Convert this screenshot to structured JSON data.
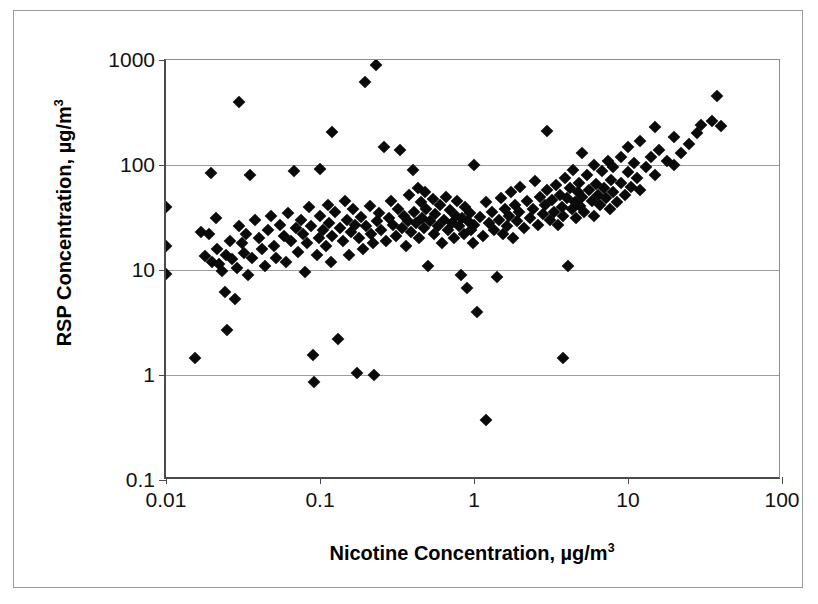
{
  "chart_data": {
    "type": "scatter",
    "title": "",
    "xlabel": "Nicotine Concentration, µg/m",
    "xlabel_sup": "3",
    "ylabel": "RSP Concentration, µg/m",
    "ylabel_sup": "3",
    "xscale": "log",
    "yscale": "log",
    "xlim": [
      0.01,
      100
    ],
    "ylim": [
      0.1,
      1000
    ],
    "xticks": [
      "0.01",
      "0.1",
      "1",
      "10",
      "100"
    ],
    "xtick_values": [
      0.01,
      0.1,
      1,
      10,
      100
    ],
    "yticks": [
      "0.1",
      "1",
      "10",
      "100",
      "1000"
    ],
    "ytick_values": [
      0.1,
      1,
      10,
      100,
      1000
    ],
    "grid": "horizontal",
    "legend": "none",
    "marker": "diamond",
    "marker_color": "#0a0a0a",
    "series": [
      {
        "name": "RSP vs Nicotine",
        "points": [
          [
            0.01,
            40
          ],
          [
            0.01,
            17
          ],
          [
            0.01,
            9.2
          ],
          [
            0.0155,
            1.45
          ],
          [
            0.017,
            23
          ],
          [
            0.018,
            13.5
          ],
          [
            0.019,
            22
          ],
          [
            0.0195,
            83
          ],
          [
            0.02,
            12
          ],
          [
            0.021,
            31
          ],
          [
            0.0215,
            16
          ],
          [
            0.022,
            11.5
          ],
          [
            0.023,
            9.8
          ],
          [
            0.024,
            6.2
          ],
          [
            0.0245,
            14
          ],
          [
            0.025,
            2.7
          ],
          [
            0.026,
            19
          ],
          [
            0.027,
            12.8
          ],
          [
            0.028,
            5.3
          ],
          [
            0.029,
            10.5
          ],
          [
            0.03,
            400
          ],
          [
            0.03,
            26
          ],
          [
            0.031,
            18
          ],
          [
            0.032,
            14.5
          ],
          [
            0.033,
            22
          ],
          [
            0.034,
            9.0
          ],
          [
            0.035,
            81
          ],
          [
            0.036,
            13
          ],
          [
            0.038,
            30
          ],
          [
            0.04,
            20
          ],
          [
            0.042,
            16
          ],
          [
            0.044,
            11
          ],
          [
            0.046,
            24
          ],
          [
            0.048,
            33
          ],
          [
            0.05,
            17
          ],
          [
            0.052,
            13
          ],
          [
            0.055,
            27
          ],
          [
            0.058,
            21
          ],
          [
            0.06,
            12
          ],
          [
            0.062,
            35
          ],
          [
            0.065,
            19
          ],
          [
            0.068,
            88
          ],
          [
            0.07,
            25
          ],
          [
            0.072,
            15
          ],
          [
            0.075,
            30
          ],
          [
            0.078,
            22
          ],
          [
            0.08,
            9.5
          ],
          [
            0.082,
            18
          ],
          [
            0.085,
            40
          ],
          [
            0.088,
            26
          ],
          [
            0.09,
            1.55
          ],
          [
            0.092,
            0.85
          ],
          [
            0.095,
            14
          ],
          [
            0.098,
            20
          ],
          [
            0.1,
            92
          ],
          [
            0.1,
            33
          ],
          [
            0.105,
            24
          ],
          [
            0.11,
            17
          ],
          [
            0.112,
            42
          ],
          [
            0.115,
            28
          ],
          [
            0.118,
            12
          ],
          [
            0.12,
            205
          ],
          [
            0.12,
            21
          ],
          [
            0.125,
            36
          ],
          [
            0.13,
            2.2
          ],
          [
            0.135,
            25
          ],
          [
            0.14,
            19
          ],
          [
            0.145,
            45
          ],
          [
            0.15,
            30
          ],
          [
            0.155,
            14
          ],
          [
            0.16,
            23
          ],
          [
            0.165,
            38
          ],
          [
            0.17,
            27
          ],
          [
            0.175,
            1.05
          ],
          [
            0.18,
            20
          ],
          [
            0.185,
            32
          ],
          [
            0.19,
            16
          ],
          [
            0.195,
            620
          ],
          [
            0.2,
            26
          ],
          [
            0.21,
            41
          ],
          [
            0.215,
            22
          ],
          [
            0.22,
            18
          ],
          [
            0.225,
            1.0
          ],
          [
            0.23,
            900
          ],
          [
            0.235,
            29
          ],
          [
            0.24,
            35
          ],
          [
            0.25,
            24
          ],
          [
            0.26,
            150
          ],
          [
            0.27,
            19
          ],
          [
            0.28,
            31
          ],
          [
            0.29,
            45
          ],
          [
            0.3,
            27
          ],
          [
            0.31,
            21
          ],
          [
            0.32,
            38
          ],
          [
            0.33,
            140
          ],
          [
            0.34,
            25
          ],
          [
            0.35,
            33
          ],
          [
            0.36,
            17
          ],
          [
            0.37,
            29
          ],
          [
            0.38,
            52
          ],
          [
            0.39,
            23
          ],
          [
            0.4,
            90
          ],
          [
            0.41,
            36
          ],
          [
            0.42,
            28
          ],
          [
            0.43,
            60
          ],
          [
            0.44,
            20
          ],
          [
            0.45,
            44
          ],
          [
            0.46,
            31
          ],
          [
            0.47,
            25
          ],
          [
            0.48,
            55
          ],
          [
            0.49,
            38
          ],
          [
            0.5,
            11
          ],
          [
            0.52,
            29
          ],
          [
            0.54,
            47
          ],
          [
            0.55,
            22
          ],
          [
            0.56,
            34
          ],
          [
            0.58,
            26
          ],
          [
            0.6,
            42
          ],
          [
            0.62,
            18
          ],
          [
            0.64,
            30
          ],
          [
            0.66,
            50
          ],
          [
            0.68,
            24
          ],
          [
            0.7,
            37
          ],
          [
            0.72,
            28
          ],
          [
            0.74,
            20
          ],
          [
            0.76,
            33
          ],
          [
            0.78,
            45
          ],
          [
            0.8,
            26
          ],
          [
            0.82,
            9.0
          ],
          [
            0.84,
            31
          ],
          [
            0.86,
            22
          ],
          [
            0.88,
            40
          ],
          [
            0.9,
            6.8
          ],
          [
            0.92,
            29
          ],
          [
            0.94,
            35
          ],
          [
            0.96,
            24
          ],
          [
            0.98,
            18
          ],
          [
            1.0,
            100
          ],
          [
            1.0,
            27
          ],
          [
            1.05,
            4.0
          ],
          [
            1.1,
            32
          ],
          [
            1.15,
            21
          ],
          [
            1.2,
            0.37
          ],
          [
            1.2,
            44
          ],
          [
            1.25,
            28
          ],
          [
            1.3,
            36
          ],
          [
            1.35,
            24
          ],
          [
            1.4,
            8.5
          ],
          [
            1.45,
            30
          ],
          [
            1.5,
            48
          ],
          [
            1.55,
            22
          ],
          [
            1.6,
            38
          ],
          [
            1.65,
            26
          ],
          [
            1.7,
            33
          ],
          [
            1.75,
            55
          ],
          [
            1.8,
            20
          ],
          [
            1.85,
            42
          ],
          [
            1.9,
            29
          ],
          [
            1.95,
            36
          ],
          [
            2.0,
            62
          ],
          [
            2.1,
            25
          ],
          [
            2.2,
            45
          ],
          [
            2.3,
            31
          ],
          [
            2.4,
            38
          ],
          [
            2.5,
            70
          ],
          [
            2.6,
            27
          ],
          [
            2.7,
            50
          ],
          [
            2.8,
            34
          ],
          [
            2.9,
            42
          ],
          [
            3.0,
            210
          ],
          [
            3.0,
            58
          ],
          [
            3.1,
            30
          ],
          [
            3.2,
            46
          ],
          [
            3.3,
            36
          ],
          [
            3.4,
            65
          ],
          [
            3.5,
            27
          ],
          [
            3.6,
            52
          ],
          [
            3.7,
            40
          ],
          [
            3.8,
            1.45
          ],
          [
            3.8,
            33
          ],
          [
            3.9,
            75
          ],
          [
            4.0,
            48
          ],
          [
            4.1,
            11
          ],
          [
            4.2,
            60
          ],
          [
            4.3,
            38
          ],
          [
            4.4,
            90
          ],
          [
            4.5,
            44
          ],
          [
            4.6,
            31
          ],
          [
            4.7,
            55
          ],
          [
            4.8,
            68
          ],
          [
            4.9,
            41
          ],
          [
            5.0,
            130
          ],
          [
            5.0,
            50
          ],
          [
            5.2,
            36
          ],
          [
            5.4,
            80
          ],
          [
            5.6,
            58
          ],
          [
            5.8,
            45
          ],
          [
            6.0,
            100
          ],
          [
            6.0,
            33
          ],
          [
            6.2,
            66
          ],
          [
            6.4,
            52
          ],
          [
            6.6,
            42
          ],
          [
            6.8,
            88
          ],
          [
            7.0,
            60
          ],
          [
            7.2,
            48
          ],
          [
            7.4,
            110
          ],
          [
            7.6,
            38
          ],
          [
            7.8,
            72
          ],
          [
            8.0,
            95
          ],
          [
            8.0,
            55
          ],
          [
            8.5,
            44
          ],
          [
            9.0,
            120
          ],
          [
            9.0,
            68
          ],
          [
            9.5,
            52
          ],
          [
            10.0,
            150
          ],
          [
            10.0,
            85
          ],
          [
            10.5,
            62
          ],
          [
            11.0,
            105
          ],
          [
            11.5,
            75
          ],
          [
            12.0,
            170
          ],
          [
            12.0,
            58
          ],
          [
            13.0,
            95
          ],
          [
            14.0,
            120
          ],
          [
            15.0,
            230
          ],
          [
            15.0,
            80
          ],
          [
            16.0,
            140
          ],
          [
            18.0,
            110
          ],
          [
            20.0,
            185
          ],
          [
            20.0,
            100
          ],
          [
            22.0,
            130
          ],
          [
            25.0,
            160
          ],
          [
            28.0,
            200
          ],
          [
            30.0,
            240
          ],
          [
            35.0,
            260
          ],
          [
            38.0,
            450
          ],
          [
            40.0,
            235
          ]
        ]
      }
    ]
  }
}
